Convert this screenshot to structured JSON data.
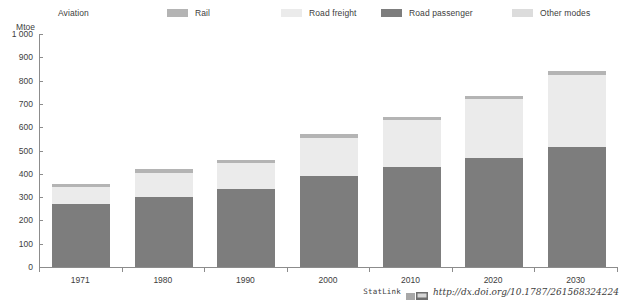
{
  "chart_data": {
    "type": "bar",
    "subtype": "stacked",
    "title": "",
    "xlabel": "",
    "ylabel": "Mtoe",
    "ylim": [
      0,
      1000
    ],
    "yticks": [
      "0",
      "100",
      "200",
      "300",
      "400",
      "500",
      "600",
      "700",
      "800",
      "900",
      "1 000"
    ],
    "ytick_values": [
      0,
      100,
      200,
      300,
      400,
      500,
      600,
      700,
      800,
      900,
      1000
    ],
    "grid": false,
    "legend_position": "top",
    "categories": [
      "1971",
      "1980",
      "1990",
      "2000",
      "2010",
      "2020",
      "2030"
    ],
    "stack_order_bottom_to_top": [
      "Road passenger",
      "Road freight",
      "Rail",
      "Aviation",
      "Other modes"
    ],
    "series": [
      {
        "name": "Road passenger",
        "color": "#7d7d7d",
        "values": [
          270,
          300,
          335,
          390,
          430,
          470,
          515
        ]
      },
      {
        "name": "Road freight",
        "color": "#ebebeb",
        "values": [
          73,
          105,
          110,
          165,
          200,
          250,
          310
        ]
      },
      {
        "name": "Rail",
        "color": "#b4b4b4",
        "values": [
          14,
          14,
          14,
          14,
          14,
          14,
          15
        ]
      },
      {
        "name": "Aviation",
        "color": "#ffffff",
        "values": [
          0,
          0,
          0,
          0,
          0,
          0,
          0
        ]
      },
      {
        "name": "Other modes",
        "color": "#dcdcdc",
        "values": [
          0,
          0,
          0,
          0,
          0,
          0,
          0
        ]
      }
    ],
    "totals": [
      357,
      419,
      459,
      569,
      644,
      734,
      840
    ]
  },
  "legend": {
    "items": [
      {
        "label": "Aviation",
        "color": "#ffffff",
        "left": 30,
        "text_left": 58
      },
      {
        "label": "Rail",
        "color": "#b4b4b4",
        "left": 167,
        "text_left": 195
      },
      {
        "label": "Road freight",
        "color": "#ebebeb",
        "left": 281,
        "text_left": 309
      },
      {
        "label": "Road passenger",
        "color": "#7d7d7d",
        "left": 381,
        "text_left": 409
      },
      {
        "label": "Other modes",
        "color": "#dcdcdc",
        "left": 512,
        "text_left": 540
      }
    ]
  },
  "axis": {
    "y_unit": "Mtoe"
  },
  "footer": {
    "statlink_word": "StatLink",
    "statlink_icon": "statlink-badge-icon",
    "url": "http://dx.doi.org/10.1787/261568324224"
  },
  "colors": {
    "axis_line": "#8c8c8c",
    "text": "#3d3d3d",
    "background": "#ffffff",
    "road_passenger": "#7d7d7d",
    "road_freight": "#ebebeb",
    "rail": "#b4b4b4",
    "aviation": "#ffffff",
    "other_modes": "#dcdcdc"
  }
}
